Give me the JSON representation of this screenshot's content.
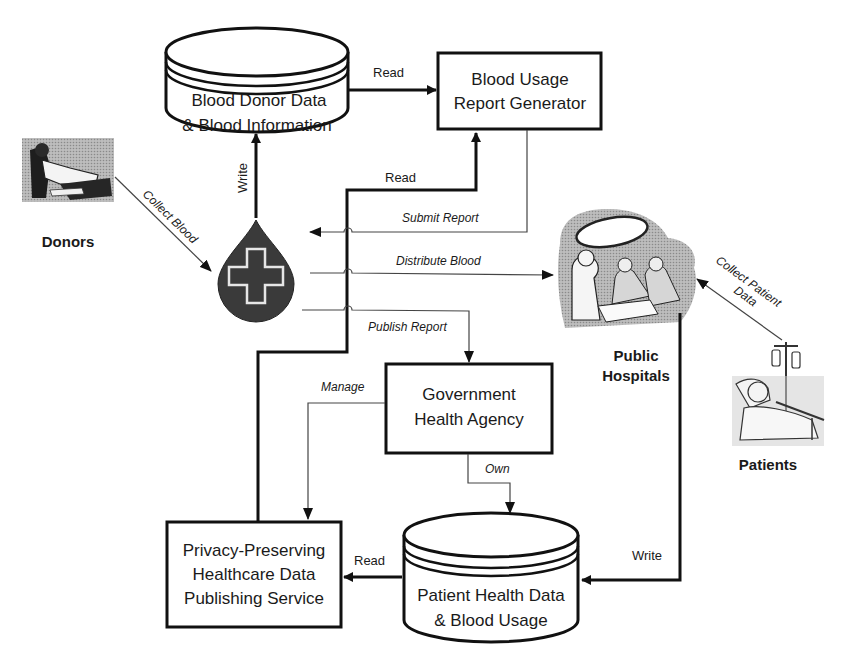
{
  "diagram": {
    "nodes": {
      "donor_db": {
        "line1": "Blood Donor  Data",
        "line2": "& Blood Information",
        "shape": "database"
      },
      "report_gen": {
        "line1": "Blood Usage",
        "line2": "Report Generator",
        "shape": "box"
      },
      "blood_bank": {
        "icon": "blood-drop-cross-icon",
        "shape": "icon"
      },
      "donors": {
        "label": "Donors",
        "icon": "donor-person-icon"
      },
      "hospitals": {
        "line1": "Public",
        "line2": "Hospitals",
        "icon": "surgeons-operating-icon"
      },
      "patients": {
        "label": "Patients",
        "icon": "patient-in-bed-icon"
      },
      "gov_agency": {
        "line1": "Government",
        "line2": "Health Agency",
        "shape": "box"
      },
      "publishing_service": {
        "line1": "Privacy-Preserving",
        "line2": "Healthcare Data",
        "line3": "Publishing  Service",
        "shape": "box"
      },
      "patient_db": {
        "line1": "Patient Health Data",
        "line2": "& Blood Usage",
        "shape": "database"
      }
    },
    "edges": {
      "read_top": "Read",
      "write_left": "Write",
      "read_mid": "Read",
      "collect_blood": "Collect Blood",
      "submit_report": "Submit Report",
      "distribute_blood": "Distribute Blood",
      "publish_report": "Publish Report",
      "collect_patient_line1": "Collect Patient",
      "collect_patient_line2": "Data",
      "manage": "Manage",
      "own": "Own",
      "read_bottom": "Read",
      "write_right": "Write"
    },
    "colors": {
      "line": "#111111",
      "drop_fill": "#3a3a3a",
      "icon_gray": "#9a9a9a"
    }
  }
}
